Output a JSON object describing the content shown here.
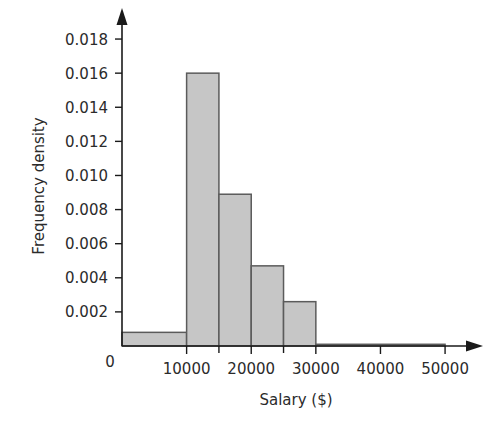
{
  "chart_data": {
    "type": "bar",
    "title": "",
    "xlabel": "Salary ($)",
    "ylabel": "Frequency density",
    "xlim": [
      0,
      52000
    ],
    "ylim": [
      0,
      0.019
    ],
    "grid": false,
    "legend": "none",
    "origin_label": "0",
    "x_ticks": [
      10000,
      20000,
      30000,
      40000,
      50000
    ],
    "x_tick_labels": [
      "10000",
      "20000",
      "30000",
      "40000",
      "50000"
    ],
    "x_minor_ticks": [
      15000,
      25000
    ],
    "y_ticks": [
      0.002,
      0.004,
      0.006,
      0.008,
      0.01,
      0.012,
      0.014,
      0.016,
      0.018
    ],
    "y_tick_labels": [
      "0.002",
      "0.004",
      "0.006",
      "0.008",
      "0.010",
      "0.012",
      "0.014",
      "0.016",
      "0.018"
    ],
    "bins": [
      {
        "label": "0-10000",
        "start": 0,
        "end": 10000,
        "value": 0.0008
      },
      {
        "label": "10000-15000",
        "start": 10000,
        "end": 15000,
        "value": 0.016
      },
      {
        "label": "15000-20000",
        "start": 15000,
        "end": 20000,
        "value": 0.0089
      },
      {
        "label": "20000-25000",
        "start": 20000,
        "end": 25000,
        "value": 0.0047
      },
      {
        "label": "25000-30000",
        "start": 25000,
        "end": 30000,
        "value": 0.0026
      },
      {
        "label": "30000-50000",
        "start": 30000,
        "end": 50000,
        "value": 0.0001
      }
    ],
    "categories": [
      "0-10000",
      "10000-15000",
      "15000-20000",
      "20000-25000",
      "25000-30000",
      "30000-50000"
    ],
    "values": [
      0.0008,
      0.016,
      0.0089,
      0.0047,
      0.0026,
      0.0001
    ],
    "colors": {
      "bar_fill": "#c6c6c6",
      "bar_stroke": "#5b5b5b",
      "axis": "#1a1a1a",
      "text": "#2b2b2b",
      "background": "#ffffff"
    }
  }
}
